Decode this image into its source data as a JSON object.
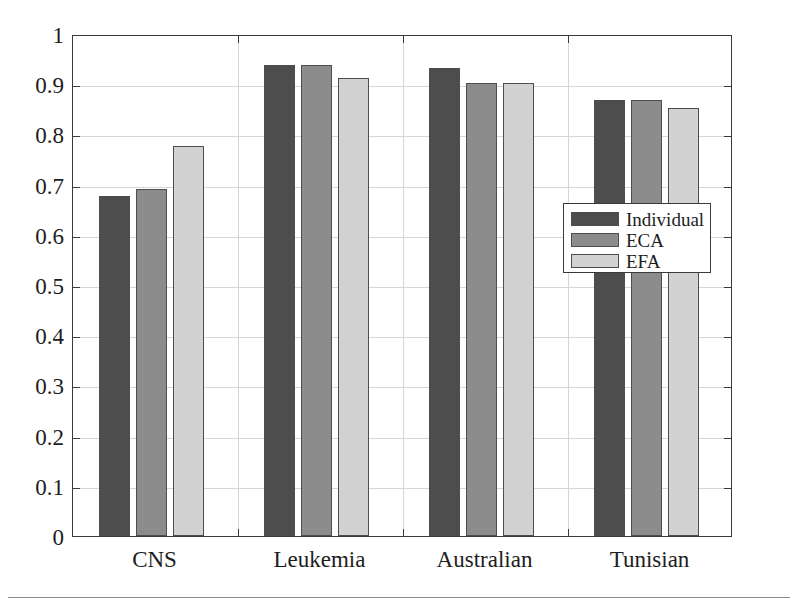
{
  "chart_data": {
    "type": "bar",
    "title": "",
    "xlabel": "",
    "ylabel": "",
    "categories": [
      "CNS",
      "Leukemia",
      "Australian",
      "Tunisian"
    ],
    "series": [
      {
        "name": "Individual",
        "color": "#4d4d4d",
        "values": [
          0.678,
          0.938,
          0.932,
          0.868
        ]
      },
      {
        "name": "ECA",
        "color": "#8c8c8c",
        "values": [
          0.692,
          0.938,
          0.903,
          0.868
        ]
      },
      {
        "name": "EFA",
        "color": "#d2d2d2",
        "values": [
          0.777,
          0.913,
          0.903,
          0.852
        ]
      }
    ],
    "ylim": [
      0,
      1
    ],
    "yticks": [
      "0",
      "0.1",
      "0.2",
      "0.3",
      "0.4",
      "0.5",
      "0.6",
      "0.7",
      "0.8",
      "0.9",
      "1"
    ],
    "ytick_values": [
      0,
      0.1,
      0.2,
      0.3,
      0.4,
      0.5,
      0.6,
      0.7,
      0.8,
      0.9,
      1
    ],
    "grid": true,
    "grid_color": "#d6d6d6",
    "axis_color": "#3a3a3a",
    "bar_edge_color": "#4e4e4e",
    "legend": {
      "position": "center-right",
      "entries": [
        "Individual",
        "ECA",
        "EFA"
      ]
    }
  }
}
